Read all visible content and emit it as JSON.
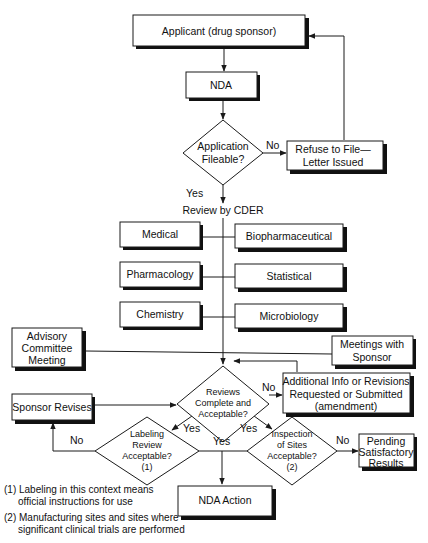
{
  "diagram": {
    "type": "flowchart",
    "nodes": {
      "applicant": "Applicant (drug sponsor)",
      "nda": "NDA",
      "application_fileable": [
        "Application",
        "Fileable?"
      ],
      "refuse_to_file": [
        "Refuse to File—",
        "Letter Issued"
      ],
      "review_by_cder": "Review by CDER",
      "medical": "Medical",
      "biopharmaceutical": "Biopharmaceutical",
      "pharmacology": "Pharmacology",
      "statistical": "Statistical",
      "chemistry": "Chemistry",
      "microbiology": "Microbiology",
      "advisory_committee": [
        "Advisory",
        "Committee",
        "Meeting"
      ],
      "meetings_with_sponsor": [
        "Meetings with",
        "Sponsor"
      ],
      "reviews_complete": [
        "Reviews",
        "Complete and",
        "Acceptable?"
      ],
      "additional_info": [
        "Additional Info or Revisions",
        "Requested or Submitted",
        "(amendment)"
      ],
      "sponsor_revises": "Sponsor Revises",
      "labeling_review": [
        "Labeling",
        "Review",
        "Acceptable?",
        "(1)"
      ],
      "inspection_of_sites": [
        "Inspection",
        "of Sites",
        "Acceptable?",
        "(2)"
      ],
      "pending_results": [
        "Pending",
        "Satisfactory",
        "Results"
      ],
      "nda_action": "NDA Action"
    },
    "edge_labels": {
      "fileable_no": "No",
      "fileable_yes": "Yes",
      "reviews_no": "No",
      "reviews_yes_left": "Yes",
      "reviews_yes_right": "Yes",
      "labeling_no": "No",
      "labeling_yes": "Yes",
      "inspection_no": "No"
    },
    "footnotes": {
      "note1_line1": "(1) Labeling in this context means",
      "note1_line2": "official instructions for use",
      "note2_line1": "(2) Manufacturing sites and sites where",
      "note2_line2": "significant clinical trials are performed"
    },
    "colors": {
      "stroke": "#1a1a1a",
      "shadow": "#111111",
      "fill": "#ffffff"
    }
  }
}
